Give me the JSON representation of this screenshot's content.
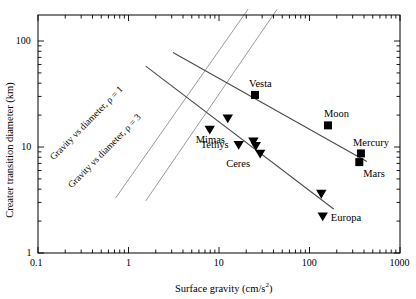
{
  "chart_data": {
    "type": "scatter",
    "title": "",
    "xlabel": "Surface gravity (cm/s²)",
    "ylabel": "Creater transition diameter (km)",
    "xscale": "log",
    "yscale": "log",
    "xlim": [
      0.1,
      1000
    ],
    "ylim": [
      1,
      200
    ],
    "grid": false,
    "legend": "none",
    "xticks": [
      0.1,
      1,
      10,
      100,
      1000
    ],
    "xtick_labels": [
      "0.1",
      "1",
      "10",
      "100",
      "1000"
    ],
    "yticks": [
      1,
      10,
      100
    ],
    "ytick_labels": [
      "1",
      "10",
      "100"
    ],
    "series": [
      {
        "name": "Rocky bodies (squares)",
        "marker": "square",
        "points": [
          {
            "label": "Vesta",
            "x": 25,
            "y": 31.0
          },
          {
            "label": "Moon",
            "x": 160,
            "y": 16.0
          },
          {
            "label": "Mercury",
            "x": 370,
            "y": 8.7
          },
          {
            "label": "Mars",
            "x": 355,
            "y": 7.2
          }
        ]
      },
      {
        "name": "Icy bodies (triangles)",
        "marker": "triangle-down",
        "points": [
          {
            "label": "",
            "x": 12.5,
            "y": 18.5
          },
          {
            "label": "Mimas",
            "x": 7.9,
            "y": 14.5
          },
          {
            "label": "Tethys",
            "x": 16.5,
            "y": 10.4
          },
          {
            "label": "",
            "x": 24.0,
            "y": 11.2
          },
          {
            "label": "",
            "x": 25.5,
            "y": 10.2
          },
          {
            "label": "Ceres",
            "x": 28.5,
            "y": 8.6
          },
          {
            "label": "",
            "x": 135,
            "y": 3.6
          },
          {
            "label": "Europa",
            "x": 140,
            "y": 2.2
          }
        ]
      }
    ],
    "fit_lines": [
      {
        "name": "rock-trend",
        "x0": 3.1,
        "y0": 78.0,
        "x1": 430,
        "y1": 7.3
      },
      {
        "name": "ice-trend",
        "x0": 1.55,
        "y0": 58.0,
        "x1": 185,
        "y1": 2.6
      }
    ],
    "reference_lines": [
      {
        "name": "gravity-vs-diameter-rho1",
        "label": "Gravity vs diameter, ρ = 1",
        "x0": 0.72,
        "y0": 3.3,
        "x1": 21.0,
        "y1": 200.0,
        "angle": -45.5
      },
      {
        "name": "gravity-vs-diameter-rho3",
        "label": "Gravity vs diameter, ρ = 3",
        "x0": 1.55,
        "y0": 3.1,
        "x1": 44.0,
        "y1": 200.0,
        "angle": -45.5
      }
    ],
    "annotations": [
      {
        "name": "label-vesta",
        "text": "Vesta"
      },
      {
        "name": "label-moon",
        "text": "Moon"
      },
      {
        "name": "label-mercury",
        "text": "Mercury"
      },
      {
        "name": "label-mars",
        "text": "Mars"
      },
      {
        "name": "label-mimas",
        "text": "Mimas"
      },
      {
        "name": "label-tethys",
        "text": "Tethys"
      },
      {
        "name": "label-ceres",
        "text": "Ceres"
      },
      {
        "name": "label-europa",
        "text": "Europa"
      }
    ],
    "colors": {
      "axis": "#000000",
      "marker": "#000000",
      "fit_line": "#4a4a4a",
      "reference_line": "#9a9a9a",
      "background": "#ffffff"
    }
  },
  "axes": {
    "x_title": "Surface gravity (cm/s",
    "x_title_sup": "2",
    "x_title_tail": ")",
    "y_title": "Creater transition diameter (km)"
  },
  "tick_labels": {
    "x": [
      "0.1",
      "1",
      "10",
      "100",
      "1000"
    ],
    "y": [
      "1",
      "10",
      "100"
    ]
  },
  "point_labels": {
    "vesta": "Vesta",
    "moon": "Moon",
    "mercury": "Mercury",
    "mars": "Mars",
    "mimas": "Mimas",
    "tethys": "Tethys",
    "ceres": "Ceres",
    "europa": "Europa"
  },
  "reference_labels": {
    "rho1": "Gravity vs diameter, ρ = 1",
    "rho3": "Gravity vs diameter, ρ = 3"
  }
}
